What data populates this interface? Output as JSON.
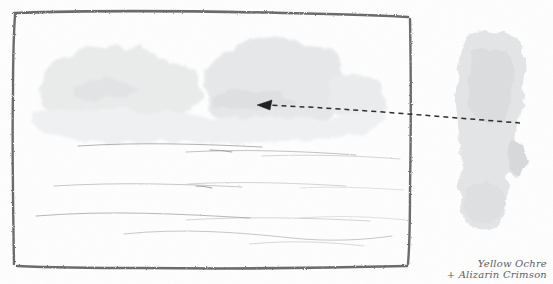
{
  "page": {
    "background_color": "#fefefe",
    "width": 553,
    "height": 284
  },
  "artwork": {
    "frame": {
      "name": "pencil-drawn-rectangle-border",
      "color": "#6b6b6d",
      "x": 13,
      "y": 12,
      "width": 397,
      "height": 256
    },
    "sky": {
      "label": "cloud-wash",
      "color": "#e9eaeb",
      "description": "Pale grey cumulus cloud wash across upper half"
    },
    "landscape": {
      "label": "horizon-pencil-lines",
      "color": "#9a9a9d",
      "description": "Faint horizontal pencil contour lines suggesting distant fields"
    }
  },
  "swatch": {
    "name": "paint-mixture-swatch",
    "color": "#e4e5e6",
    "x": 455,
    "y": 30,
    "width": 78,
    "height": 200
  },
  "annotation": {
    "arrow": {
      "name": "dashed-pointer-arrow",
      "color": "#2b2b2b",
      "direction": "left",
      "from_x": 520,
      "from_y": 123,
      "to_x": 258,
      "to_y": 105,
      "style": "dashed"
    }
  },
  "caption": {
    "line1": "Yellow Ochre",
    "line2": "+ Alizarin Crimson",
    "color": "#5d5c5e"
  }
}
